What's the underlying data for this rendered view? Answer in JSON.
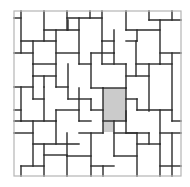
{
  "diagram": {
    "frame": {
      "x": 14,
      "y": 11,
      "w": 167,
      "h": 165
    },
    "colors": {
      "line": "#2a2a2a",
      "frame": "#b5b5b5",
      "highlight": "#cbcbcb",
      "background": "#ffffff"
    },
    "highlight": [
      {
        "x": 103,
        "y": 88,
        "w": 23,
        "h": 33
      },
      {
        "x": 103,
        "y": 121,
        "w": 11,
        "h": 11
      }
    ]
  }
}
